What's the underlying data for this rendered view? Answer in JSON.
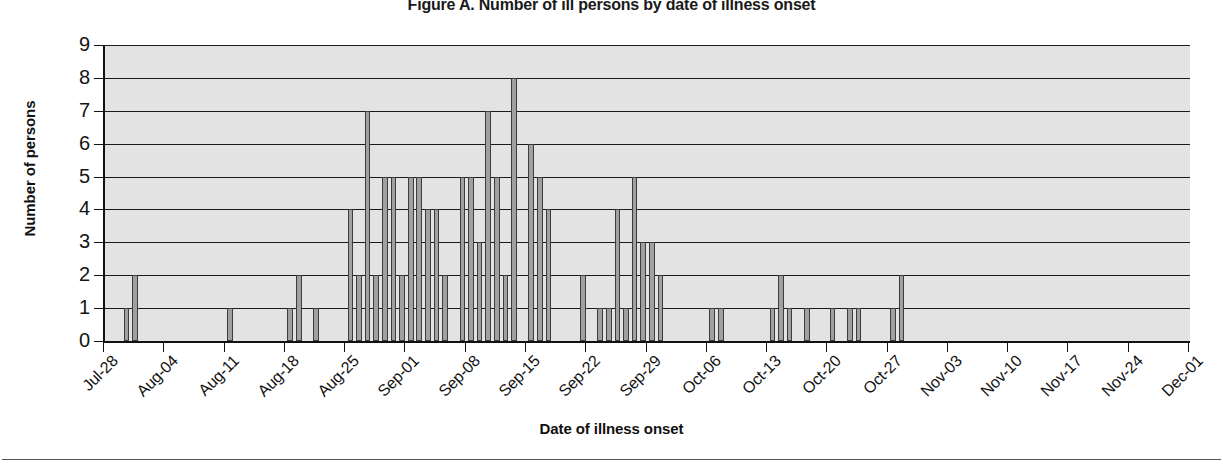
{
  "figure": {
    "title": "Figure A. Number of ill persons by date of illness onset",
    "x_axis_title": "Date of illness onset",
    "y_axis_title": "Number of persons"
  },
  "chart_data": {
    "type": "bar",
    "title": "Figure A. Number of ill persons by date of illness onset",
    "xlabel": "Date of illness onset",
    "ylabel": "Number of persons",
    "ylim": [
      0,
      9
    ],
    "ytick_labels": [
      "0",
      "1",
      "2",
      "3",
      "4",
      "5",
      "6",
      "7",
      "8",
      "9"
    ],
    "ytick_values": [
      0,
      1,
      2,
      3,
      4,
      5,
      6,
      7,
      8,
      9
    ],
    "grid": true,
    "legend": "none",
    "x_axis_type": "date",
    "x_start": "Jul-28",
    "x_end": "Dec-01",
    "xtick_labels": [
      "Jul-28",
      "Aug-04",
      "Aug-11",
      "Aug-18",
      "Aug-25",
      "Sep-01",
      "Sep-08",
      "Sep-15",
      "Sep-22",
      "Sep-29",
      "Oct-06",
      "Oct-13",
      "Oct-20",
      "Oct-27",
      "Nov-03",
      "Nov-10",
      "Nov-17",
      "Nov-24",
      "Dec-01"
    ],
    "xtick_day_offsets": [
      0,
      7,
      14,
      21,
      28,
      35,
      42,
      49,
      56,
      63,
      70,
      77,
      84,
      91,
      98,
      105,
      112,
      119,
      126
    ],
    "bar_unit": "day",
    "days_total": 127,
    "categories": [
      "Jul-28",
      "Jul-29",
      "Jul-30",
      "Jul-31",
      "Aug-01",
      "Aug-02",
      "Aug-03",
      "Aug-04",
      "Aug-05",
      "Aug-06",
      "Aug-07",
      "Aug-08",
      "Aug-09",
      "Aug-10",
      "Aug-11",
      "Aug-12",
      "Aug-13",
      "Aug-14",
      "Aug-15",
      "Aug-16",
      "Aug-17",
      "Aug-18",
      "Aug-19",
      "Aug-20",
      "Aug-21",
      "Aug-22",
      "Aug-23",
      "Aug-24",
      "Aug-25",
      "Aug-26",
      "Aug-27",
      "Aug-28",
      "Aug-29",
      "Aug-30",
      "Aug-31",
      "Sep-01",
      "Sep-02",
      "Sep-03",
      "Sep-04",
      "Sep-05",
      "Sep-06",
      "Sep-07",
      "Sep-08",
      "Sep-09",
      "Sep-10",
      "Sep-11",
      "Sep-12",
      "Sep-13",
      "Sep-14",
      "Sep-15",
      "Sep-16",
      "Sep-17",
      "Sep-18",
      "Sep-19",
      "Sep-20",
      "Sep-21",
      "Sep-22",
      "Sep-23",
      "Sep-24",
      "Sep-25",
      "Sep-26",
      "Sep-27",
      "Sep-28",
      "Sep-29",
      "Sep-30",
      "Oct-01",
      "Oct-02",
      "Oct-03",
      "Oct-04",
      "Oct-05",
      "Oct-06",
      "Oct-07",
      "Oct-08",
      "Oct-09",
      "Oct-10",
      "Oct-11",
      "Oct-12",
      "Oct-13",
      "Oct-14",
      "Oct-15",
      "Oct-16",
      "Oct-17",
      "Oct-18",
      "Oct-19",
      "Oct-20",
      "Oct-21",
      "Oct-22",
      "Oct-23",
      "Oct-24",
      "Oct-25",
      "Oct-26",
      "Oct-27",
      "Oct-28",
      "Oct-29",
      "Oct-30",
      "Oct-31",
      "Nov-01",
      "Nov-02",
      "Nov-03",
      "Nov-04",
      "Nov-05",
      "Nov-06",
      "Nov-07",
      "Nov-08",
      "Nov-09",
      "Nov-10",
      "Nov-11",
      "Nov-12",
      "Nov-13",
      "Nov-14",
      "Nov-15",
      "Nov-16",
      "Nov-17",
      "Nov-18",
      "Nov-19",
      "Nov-20",
      "Nov-21",
      "Nov-22",
      "Nov-23",
      "Nov-24",
      "Nov-25",
      "Nov-26",
      "Nov-27",
      "Nov-28",
      "Nov-29",
      "Nov-30",
      "Dec-01"
    ],
    "values": [
      0,
      0,
      1,
      2,
      0,
      0,
      0,
      0,
      0,
      0,
      0,
      0,
      0,
      0,
      1,
      0,
      0,
      0,
      0,
      0,
      0,
      1,
      2,
      0,
      1,
      0,
      0,
      0,
      4,
      2,
      7,
      2,
      5,
      5,
      2,
      5,
      5,
      4,
      4,
      2,
      0,
      5,
      5,
      3,
      7,
      5,
      2,
      8,
      0,
      6,
      5,
      4,
      0,
      0,
      0,
      2,
      0,
      1,
      1,
      4,
      1,
      5,
      3,
      3,
      2,
      0,
      0,
      0,
      0,
      0,
      1,
      1,
      0,
      0,
      0,
      0,
      0,
      1,
      2,
      1,
      0,
      1,
      0,
      0,
      1,
      0,
      1,
      1,
      0,
      0,
      0,
      1,
      2,
      0,
      0,
      0,
      0,
      0,
      0,
      0,
      0,
      0,
      0,
      0,
      0,
      0,
      0,
      0,
      0,
      0,
      0,
      0,
      0,
      0,
      0,
      0,
      0,
      0,
      0,
      0,
      0,
      0,
      0,
      0,
      0,
      0,
      0
    ],
    "max_value": 8,
    "total_cases": 132
  }
}
